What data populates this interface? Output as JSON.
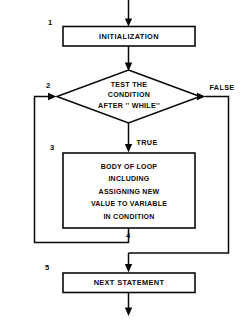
{
  "diagram": {
    "type": "flowchart",
    "colors": {
      "stroke": "#0a0a0a",
      "fill": "#ffffff",
      "background": "#ffffff"
    },
    "nodes": {
      "initialization": {
        "step": "1",
        "shape": "process",
        "label": "INITIALIZATION"
      },
      "condition": {
        "step": "2",
        "shape": "decision",
        "line1": "TEST THE",
        "line2": "CONDITION",
        "line3": "AFTER '' WHILE''"
      },
      "body": {
        "step": "3",
        "shape": "process",
        "line1": "BODY OF LOOP",
        "line2": "INCLUDING",
        "line3": "ASSIGNING NEW",
        "line4": "VALUE TO VARIABLE",
        "line5": "IN CONDITION"
      },
      "loopback": {
        "step": "4",
        "shape": "junction"
      },
      "next_statement": {
        "step": "5",
        "shape": "process",
        "label": "NEXT STATEMENT"
      }
    },
    "branches": {
      "true_label": "TRUE",
      "false_label": "FALSE"
    }
  }
}
